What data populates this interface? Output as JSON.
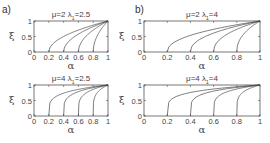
{
  "figure": {
    "panel_labels": [
      "a)",
      "b)"
    ],
    "xlabel": "α",
    "ylabel": "ξ"
  },
  "panels": [
    {
      "id": "a-top",
      "mu_label": "μ=2",
      "lambda_label": "λ",
      "lambda_sub": "1",
      "lambda_val": "=2.5",
      "box": {
        "x": 34,
        "y": 21,
        "w": 74,
        "h": 31
      },
      "xticks": [
        "0",
        "0.2",
        "0.4",
        "0.6",
        "0.8",
        "1"
      ],
      "yticks": [
        "0",
        "0.5",
        "1"
      ],
      "xlabel": "α",
      "ylabel": "ξ",
      "exponent": 0.5
    },
    {
      "id": "b-top",
      "mu_label": "μ=2",
      "lambda_label": "λ",
      "lambda_sub": "1",
      "lambda_val": "=4",
      "box": {
        "x": 144,
        "y": 21,
        "w": 116,
        "h": 31
      },
      "xticks": [
        "0",
        "0.2",
        "0.4",
        "0.6",
        "0.8",
        "1"
      ],
      "yticks": [
        "0",
        "0.5",
        "1"
      ],
      "xlabel": "α",
      "ylabel": "ξ",
      "exponent": 0.45
    },
    {
      "id": "a-bottom",
      "mu_label": "μ=4",
      "lambda_label": "λ",
      "lambda_sub": "1",
      "lambda_val": "=2.5",
      "box": {
        "x": 34,
        "y": 85,
        "w": 74,
        "h": 31
      },
      "xticks": [
        "0",
        "0.2",
        "0.4",
        "0.6",
        "0.8",
        "1"
      ],
      "yticks": [
        "0",
        "0.5",
        "1"
      ],
      "xlabel": "α",
      "ylabel": "ξ",
      "exponent": 0.22
    },
    {
      "id": "b-bottom",
      "mu_label": "μ=4",
      "lambda_label": "λ",
      "lambda_sub": "1",
      "lambda_val": "=4",
      "box": {
        "x": 144,
        "y": 85,
        "w": 116,
        "h": 31
      },
      "xticks": [
        "0",
        "0.2",
        "0.4",
        "0.6",
        "0.8",
        "1"
      ],
      "yticks": [
        "0",
        "0.5",
        "1"
      ],
      "xlabel": "α",
      "ylabel": "ξ",
      "exponent": 0.2
    }
  ],
  "chart_data": [
    {
      "type": "line",
      "title": "μ=2 λ1=2.5",
      "xlabel": "α",
      "ylabel": "ξ",
      "xlim": [
        0,
        1
      ],
      "ylim": [
        0,
        1
      ],
      "x_ticks": [
        0,
        0.2,
        0.4,
        0.6,
        0.8,
        1
      ],
      "y_ticks": [
        0,
        0.5,
        1
      ],
      "grid": false,
      "series": [
        {
          "name": "α0=0.2",
          "x": [
            0.2,
            0.3,
            0.4,
            0.6,
            0.8,
            1.0
          ],
          "y": [
            0,
            0.35,
            0.5,
            0.71,
            0.87,
            1.0
          ]
        },
        {
          "name": "α0=0.4",
          "x": [
            0.4,
            0.5,
            0.6,
            0.8,
            1.0
          ],
          "y": [
            0,
            0.41,
            0.58,
            0.82,
            1.0
          ]
        },
        {
          "name": "α0=0.6",
          "x": [
            0.6,
            0.7,
            0.8,
            0.9,
            1.0
          ],
          "y": [
            0,
            0.5,
            0.71,
            0.87,
            1.0
          ]
        },
        {
          "name": "α0=0.8",
          "x": [
            0.8,
            0.85,
            0.9,
            0.95,
            1.0
          ],
          "y": [
            0,
            0.5,
            0.71,
            0.87,
            1.0
          ]
        }
      ]
    },
    {
      "type": "line",
      "title": "μ=2 λ1=4",
      "xlabel": "α",
      "ylabel": "ξ",
      "xlim": [
        0,
        1
      ],
      "ylim": [
        0,
        1
      ],
      "x_ticks": [
        0,
        0.2,
        0.4,
        0.6,
        0.8,
        1
      ],
      "y_ticks": [
        0,
        0.5,
        1
      ],
      "grid": false,
      "series": [
        {
          "name": "α0=0.2",
          "x": [
            0.2,
            0.3,
            0.4,
            0.6,
            0.8,
            1.0
          ],
          "y": [
            0,
            0.39,
            0.54,
            0.73,
            0.88,
            1.0
          ]
        },
        {
          "name": "α0=0.4",
          "x": [
            0.4,
            0.5,
            0.6,
            0.8,
            1.0
          ],
          "y": [
            0,
            0.45,
            0.61,
            0.83,
            1.0
          ]
        },
        {
          "name": "α0=0.6",
          "x": [
            0.6,
            0.7,
            0.8,
            0.9,
            1.0
          ],
          "y": [
            0,
            0.54,
            0.73,
            0.88,
            1.0
          ]
        },
        {
          "name": "α0=0.8",
          "x": [
            0.8,
            0.85,
            0.9,
            0.95,
            1.0
          ],
          "y": [
            0,
            0.54,
            0.73,
            0.88,
            1.0
          ]
        }
      ]
    },
    {
      "type": "line",
      "title": "μ=4 λ1=2.5",
      "xlabel": "α",
      "ylabel": "ξ",
      "xlim": [
        0,
        1
      ],
      "ylim": [
        0,
        1
      ],
      "x_ticks": [
        0,
        0.2,
        0.4,
        0.6,
        0.8,
        1
      ],
      "y_ticks": [
        0,
        0.5,
        1
      ],
      "grid": false,
      "series": [
        {
          "name": "α0=0.2",
          "x": [
            0.2,
            0.3,
            0.4,
            0.6,
            0.8,
            1.0
          ],
          "y": [
            0,
            0.63,
            0.74,
            0.86,
            0.94,
            1.0
          ]
        },
        {
          "name": "α0=0.4",
          "x": [
            0.4,
            0.5,
            0.6,
            0.8,
            1.0
          ],
          "y": [
            0,
            0.67,
            0.79,
            0.91,
            1.0
          ]
        },
        {
          "name": "α0=0.6",
          "x": [
            0.6,
            0.7,
            0.8,
            0.9,
            1.0
          ],
          "y": [
            0,
            0.74,
            0.86,
            0.94,
            1.0
          ]
        },
        {
          "name": "α0=0.8",
          "x": [
            0.8,
            0.85,
            0.9,
            0.95,
            1.0
          ],
          "y": [
            0,
            0.74,
            0.86,
            0.94,
            1.0
          ]
        }
      ]
    },
    {
      "type": "line",
      "title": "μ=4 λ1=4",
      "xlabel": "α",
      "ylabel": "ξ",
      "xlim": [
        0,
        1
      ],
      "ylim": [
        0,
        1
      ],
      "x_ticks": [
        0,
        0.2,
        0.4,
        0.6,
        0.8,
        1
      ],
      "y_ticks": [
        0,
        0.5,
        1
      ],
      "grid": false,
      "series": [
        {
          "name": "α0=0.2",
          "x": [
            0.2,
            0.3,
            0.4,
            0.6,
            0.8,
            1.0
          ],
          "y": [
            0,
            0.66,
            0.76,
            0.87,
            0.94,
            1.0
          ]
        },
        {
          "name": "α0=0.4",
          "x": [
            0.4,
            0.5,
            0.6,
            0.8,
            1.0
          ],
          "y": [
            0,
            0.7,
            0.8,
            0.92,
            1.0
          ]
        },
        {
          "name": "α0=0.6",
          "x": [
            0.6,
            0.7,
            0.8,
            0.9,
            1.0
          ],
          "y": [
            0,
            0.76,
            0.87,
            0.94,
            1.0
          ]
        },
        {
          "name": "α0=0.8",
          "x": [
            0.8,
            0.85,
            0.9,
            0.95,
            1.0
          ],
          "y": [
            0,
            0.76,
            0.87,
            0.94,
            1.0
          ]
        }
      ]
    }
  ]
}
